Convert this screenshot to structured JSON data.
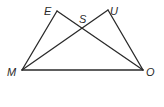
{
  "diagram": {
    "type": "geometry-figure",
    "points": [
      {
        "id": "E",
        "label": "E",
        "x": 57,
        "y": 11,
        "label_x": 44,
        "label_y": 15
      },
      {
        "id": "U",
        "label": "U",
        "x": 108,
        "y": 10,
        "label_x": 110,
        "label_y": 15
      },
      {
        "id": "S",
        "label": "S",
        "x": 83,
        "y": 28,
        "label_x": 79,
        "label_y": 23
      },
      {
        "id": "M",
        "label": "M",
        "x": 22,
        "y": 70,
        "label_x": 7,
        "label_y": 76
      },
      {
        "id": "O",
        "label": "O",
        "x": 143,
        "y": 70,
        "label_x": 146,
        "label_y": 76
      }
    ],
    "segments": [
      {
        "from": "M",
        "to": "E"
      },
      {
        "from": "E",
        "to": "O"
      },
      {
        "from": "M",
        "to": "U"
      },
      {
        "from": "U",
        "to": "O"
      },
      {
        "from": "M",
        "to": "O"
      }
    ],
    "intersection": {
      "point": "S",
      "of": [
        "EO",
        "MU"
      ]
    },
    "line_color": "#2a2a2a"
  },
  "labels": {
    "E": "E",
    "U": "U",
    "S": "S",
    "M": "M",
    "O": "O"
  }
}
